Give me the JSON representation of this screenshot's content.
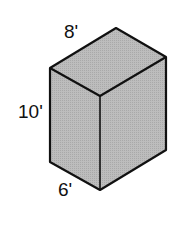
{
  "figure": {
    "type": "rectangular-prism",
    "face_color": "#b8b8b8",
    "edge_color": "#111111",
    "labels": {
      "top_edge": "8'",
      "height": "10'",
      "bottom_edge": "6'"
    }
  }
}
